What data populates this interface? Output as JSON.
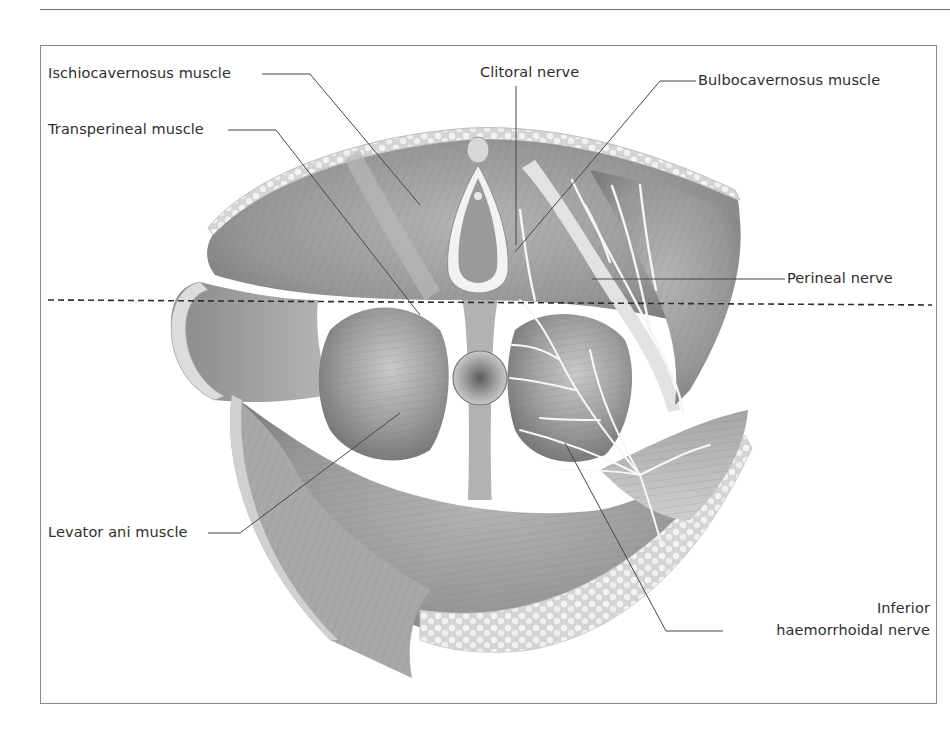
{
  "figure": {
    "labels": {
      "ischiocavernosus": "Ischiocavernosus muscle",
      "transperineal": "Transperineal muscle",
      "clitoral_nerve": "Clitoral nerve",
      "bulbocavernosus": "Bulbocavernosus muscle",
      "perineal_nerve": "Perineal nerve",
      "levator_ani": "Levator ani muscle",
      "inferior_line1": "Inferior",
      "inferior_line2": "haemorrhoidal nerve"
    },
    "colors": {
      "muscle": "#9a9a9a",
      "muscle_dark": "#7a7a7a",
      "fat": "#e6e6e6",
      "nerve": "#f4f4f4",
      "leader": "#4a4a4a",
      "frame": "#8a8a8a"
    }
  }
}
